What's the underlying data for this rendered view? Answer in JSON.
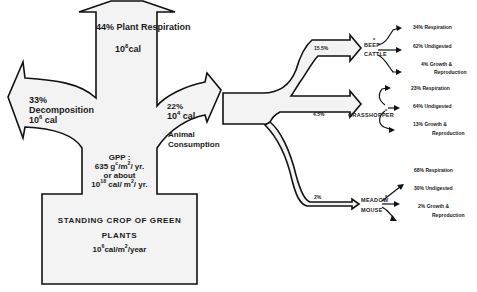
{
  "diagram": {
    "colors": {
      "fill": "#f3f3f3",
      "stroke": "#111111",
      "text": "#1a1a1a"
    },
    "source": {
      "name": "STANDING CROP OF GREEN",
      "name2": "PLANTS",
      "value_base": "10",
      "value_exp": "6",
      "value_unit": "cal/m",
      "value_unit_exp": "2",
      "value_unit_tail": "/year"
    },
    "gpp": {
      "label": "GPP :",
      "line1_num": "635 g",
      "line1_sup": "c",
      "line1_mid": "/m",
      "line1_sup2": "2",
      "line1_tail": "/ yr.",
      "line2": "or about",
      "line3_base": "10",
      "line3_exp": "18",
      "line3_unit": " cal/ m",
      "line3_sup": "2",
      "line3_tail": "/ yr."
    },
    "outputs": [
      {
        "name": "Plant Respiration",
        "percent": "44%",
        "energy_base": "10",
        "energy_exp": "8",
        "energy_unit": "cal",
        "direction": "up"
      },
      {
        "name": "Decomposition",
        "percent": "33%",
        "energy_base": "10",
        "energy_exp": "6",
        "energy_unit": " cal",
        "direction": "left"
      },
      {
        "name": "Animal Consumption",
        "name1": "Animal",
        "name2": "Consumption",
        "percent": "22%",
        "energy_base": "10",
        "energy_exp": "4",
        "energy_unit": " cal",
        "direction": "right"
      }
    ],
    "consumers": [
      {
        "name1": "BEEF",
        "name2": "CATTLE",
        "marker": "*",
        "share": "15.5%",
        "fates": [
          {
            "percent": "34%",
            "label": "Respiration"
          },
          {
            "percent": "62%",
            "label": "Undigested"
          },
          {
            "percent": "4%",
            "label": "Growth  &",
            "label2": "Reproduction"
          }
        ]
      },
      {
        "name1": "GRASSHOPPER",
        "name2": "",
        "marker": "*",
        "share": "4.5%",
        "fates": [
          {
            "percent": "23%",
            "label": "Respiration"
          },
          {
            "percent": "64%",
            "label": "Undigested"
          },
          {
            "percent": "13%",
            "label": "Growth  &",
            "label2": "Reproduction"
          }
        ]
      },
      {
        "name1": "MEADOW",
        "name2": "MOUSE",
        "marker": "*",
        "share": "2%",
        "fates": [
          {
            "percent": "68%",
            "label": "Respiration"
          },
          {
            "percent": "30%",
            "label": "Undigested"
          },
          {
            "percent": "2%",
            "label": "Growth  &",
            "label2": "Reproduction"
          }
        ]
      }
    ]
  }
}
